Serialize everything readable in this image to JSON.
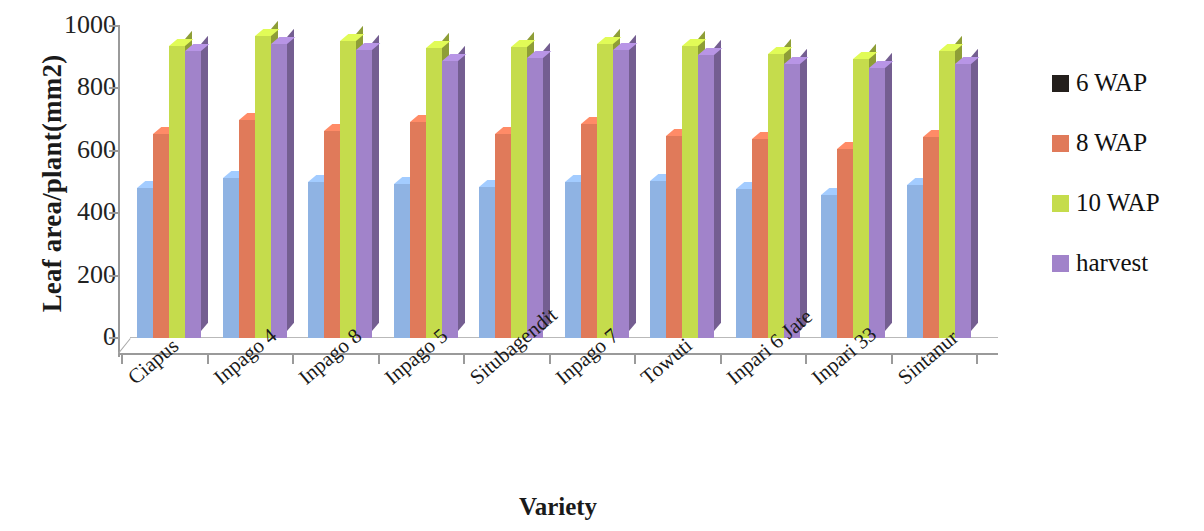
{
  "chart_data": {
    "type": "bar",
    "title": "",
    "xlabel": "Variety",
    "ylabel": "Leaf area/plant(mm2)",
    "ylim": [
      0,
      1000
    ],
    "yticks": [
      0,
      200,
      400,
      600,
      800,
      1000
    ],
    "ytick_labels": [
      "0",
      "200",
      "400",
      "600",
      "800",
      "1000"
    ],
    "grid": false,
    "legend_position": "right",
    "categories": [
      "Ciapus",
      "Inpago 4",
      "Inpago 8",
      "Inpago 5",
      "Situbagendit",
      "Inpago 7",
      "Towuti",
      "Inpari 6 Jate",
      "Inpari 33",
      "Sintanur"
    ],
    "series": [
      {
        "name": "6 WAP",
        "color": "#8fb3e3",
        "legend_swatch_color": "#241f1c",
        "values": [
          482,
          514,
          499,
          495,
          485,
          499,
          503,
          477,
          459,
          492
        ]
      },
      {
        "name": "8 WAP",
        "color": "#e07a5a",
        "legend_swatch_color": "#e07a5a",
        "values": [
          655,
          699,
          664,
          692,
          655,
          685,
          648,
          637,
          607,
          645
        ]
      },
      {
        "name": "10 WAP",
        "color": "#c5dc4c",
        "legend_swatch_color": "#c5dc4c",
        "values": [
          937,
          968,
          951,
          929,
          932,
          941,
          937,
          909,
          893,
          921
        ]
      },
      {
        "name": "harvest",
        "color": "#a183ca",
        "legend_swatch_color": "#a183ca",
        "values": [
          920,
          941,
          922,
          887,
          899,
          923,
          906,
          878,
          864,
          879
        ]
      }
    ]
  },
  "axis": {
    "y_title": "Leaf area/plant(mm2)",
    "x_title": "Variety"
  },
  "legend": {
    "entries": [
      {
        "label": "6 WAP",
        "color": "#241f1c"
      },
      {
        "label": "8 WAP",
        "color": "#e07a5a"
      },
      {
        "label": "10 WAP",
        "color": "#c5dc4c"
      },
      {
        "label": "harvest",
        "color": "#a183ca"
      }
    ]
  }
}
